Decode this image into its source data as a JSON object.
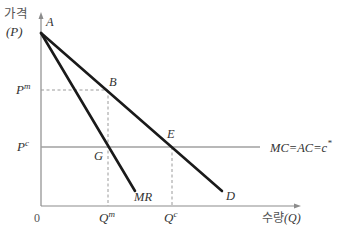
{
  "diagram": {
    "type": "monopoly-pricing",
    "axes": {
      "y_label_korean": "가격",
      "y_label_symbol": "(P)",
      "x_label_korean": "수량",
      "x_label_symbol": "(Q)",
      "origin": "0"
    },
    "price_labels": {
      "monopoly": {
        "base": "P",
        "sup": "m"
      },
      "competitive": {
        "base": "P",
        "sup": "c"
      }
    },
    "quantity_labels": {
      "monopoly": {
        "base": "Q",
        "sup": "m"
      },
      "competitive": {
        "base": "Q",
        "sup": "c"
      }
    },
    "points": {
      "A": "A",
      "B": "B",
      "E": "E",
      "G": "G"
    },
    "curves": {
      "demand": "D",
      "marginal_revenue": "MR",
      "cost_line": "MC=AC=c",
      "cost_line_sup": "*"
    },
    "colors": {
      "curve": "#1a1a1a",
      "axis": "#8c8c8c",
      "cost_line": "#a0a0a0",
      "dashed": "#9a9a9a",
      "text": "#333333"
    }
  }
}
